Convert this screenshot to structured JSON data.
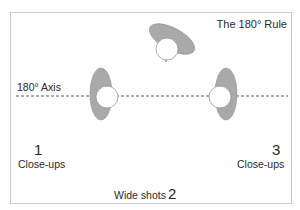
{
  "diagram": {
    "title": "The 180° Rule",
    "axis_label": "180° Axis",
    "positions": [
      {
        "number": "1",
        "label": "Close-ups"
      },
      {
        "number": "2",
        "label": "Wide shots"
      },
      {
        "number": "3",
        "label": "Close-ups"
      }
    ],
    "figures": [
      {
        "id": "left-person",
        "description": "person seen from above, facing right"
      },
      {
        "id": "top-person",
        "description": "person seen from above, tilted, facing down"
      },
      {
        "id": "right-person",
        "description": "person seen from above, facing left"
      }
    ],
    "colors": {
      "body_fill": "#a9a9a9",
      "head_fill": "#ffffff",
      "outline": "#8a8a8a",
      "axis_line": "#5a5a5a",
      "frame_border": "#c9c9c9",
      "text": "#2a2a2a"
    }
  }
}
